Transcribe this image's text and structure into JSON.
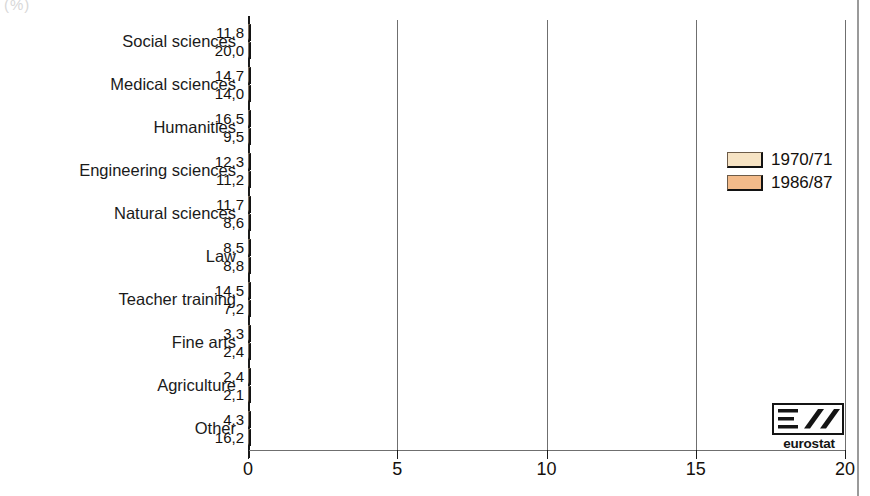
{
  "corner_mark": "(%)",
  "chart_data": {
    "type": "bar",
    "orientation": "horizontal",
    "title": "",
    "subtitle": "",
    "xlabel": "",
    "ylabel": "",
    "xlim": [
      0,
      20
    ],
    "xticks": [
      0,
      5,
      10,
      15,
      20
    ],
    "xtick_labels": [
      "0",
      "5",
      "10",
      "15",
      "20"
    ],
    "grid": "vertical",
    "decimal_separator": ",",
    "legend_position": "right",
    "categories": [
      "Social sciences",
      "Medical sciences",
      "Humanities",
      "Engineering sciences",
      "Natural sciences",
      "Law",
      "Teacher training",
      "Fine arts",
      "Agriculture",
      "Other"
    ],
    "series": [
      {
        "name": "1970/71",
        "color": "#f6e3c4",
        "values": [
          11.8,
          14.7,
          16.5,
          12.3,
          11.7,
          8.5,
          14.5,
          3.3,
          2.4,
          4.3
        ],
        "labels": [
          "11,8",
          "14,7",
          "16,5",
          "12,3",
          "11,7",
          "8,5",
          "14,5",
          "3,3",
          "2,4",
          "4,3"
        ]
      },
      {
        "name": "1986/87",
        "color": "#f3bb8a",
        "values": [
          20.0,
          14.0,
          9.5,
          11.2,
          8.6,
          8.8,
          7.2,
          2.4,
          2.1,
          16.2
        ],
        "labels": [
          "20,0",
          "14,0",
          "9,5",
          "11,2",
          "8,6",
          "8,8",
          "7,2",
          "2,4",
          "2,1",
          "16,2"
        ]
      }
    ]
  },
  "legend": {
    "items": [
      {
        "label": "1970/71",
        "color": "#f6e3c4"
      },
      {
        "label": "1986/87",
        "color": "#f3bb8a"
      }
    ]
  },
  "logo": {
    "text": "eurostat",
    "mark": "eurostat-logo-icon"
  }
}
